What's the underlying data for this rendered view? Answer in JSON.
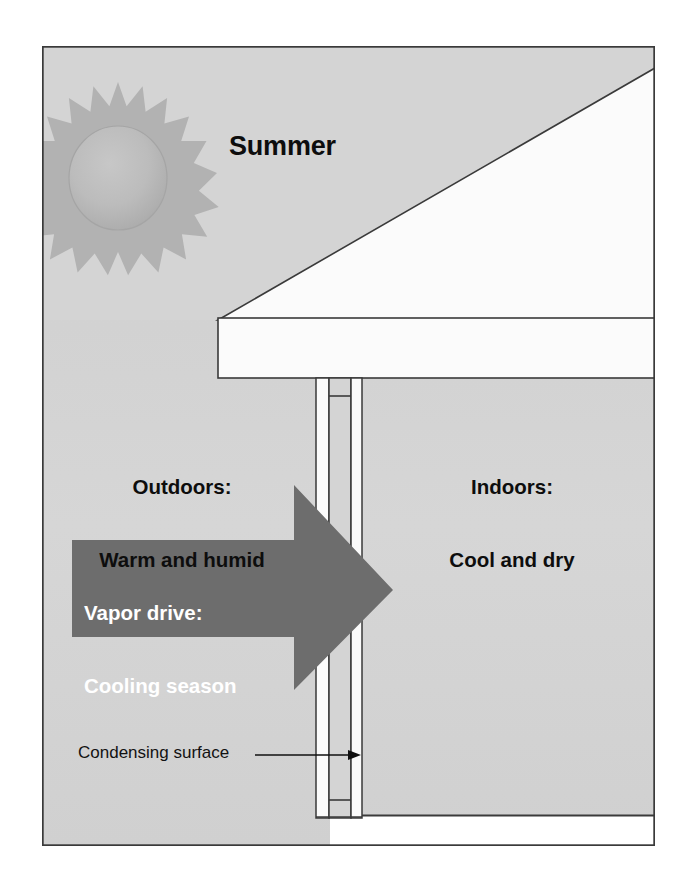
{
  "diagram": {
    "season_label": "Summer",
    "outdoors": {
      "heading": "Outdoors:",
      "description": "Warm and humid"
    },
    "indoors": {
      "heading": "Indoors:",
      "description": "Cool and dry"
    },
    "vapor_arrow": {
      "line1": "Vapor drive:",
      "line2": "Cooling season",
      "direction": "outdoors-to-indoors"
    },
    "callout": {
      "label": "Condensing surface",
      "points_to": "interior-sheathing"
    },
    "icons": {
      "sun": "sun-icon",
      "arrow": "right-arrow-icon",
      "pointer": "callout-arrow-icon"
    },
    "colors": {
      "background": "#ffffff",
      "field_gray": "#d4d4d4",
      "roof_white": "#fbfbfb",
      "arrow_gray": "#6a6a6a",
      "sun_gray": "#b4b4b4",
      "sun_core_gray": "#bdbdbd",
      "outline": "#3a3a3a",
      "text_dark": "#0d0d0d",
      "text_light": "#ffffff"
    },
    "geometry": {
      "frame": {
        "x": 42,
        "y": 46,
        "width": 613,
        "height": 800
      },
      "roof_ridge_x": 655,
      "eave_x": 218,
      "wall_top_y": 378,
      "wall_bottom_y": 818
    }
  }
}
